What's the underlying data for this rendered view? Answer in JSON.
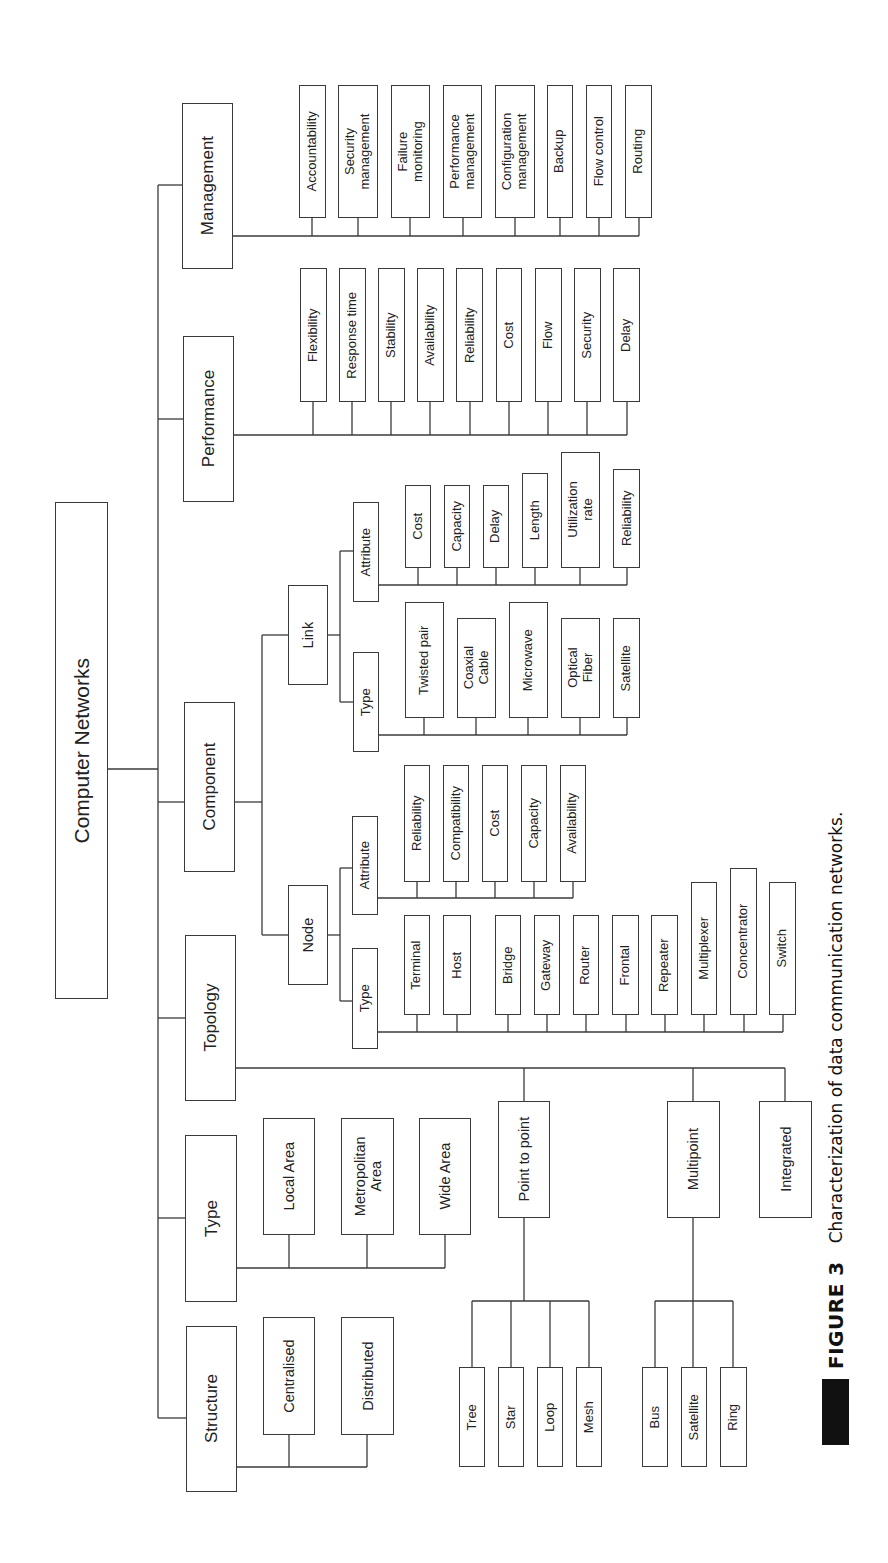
{
  "diagram": {
    "root": "Computer Networks",
    "branches": {
      "management": {
        "label": "Management",
        "children": [
          "Accountability",
          "Security\nmanagement",
          "Failure\nmonitoring",
          "Performance\nmanagement",
          "Configuration\nmanagement",
          "Backup",
          "Flow control",
          "Routing"
        ]
      },
      "performance": {
        "label": "Performance",
        "children": [
          "Flexibility",
          "Response time",
          "Stability",
          "Availability",
          "Reliability",
          "Cost",
          "Flow",
          "Security",
          "Delay"
        ]
      },
      "component": {
        "label": "Component",
        "link": {
          "label": "Link",
          "attribute": {
            "label": "Attribute",
            "children": [
              "Cost",
              "Capacity",
              "Delay",
              "Length",
              "Utilization\nrate",
              "Reliability"
            ]
          },
          "type": {
            "label": "Type",
            "children": [
              "Twisted pair",
              "Coaxial\nCable",
              "Microwave",
              "Optical\nFiber",
              "Satellite"
            ]
          }
        },
        "node": {
          "label": "Node",
          "attribute": {
            "label": "Attribute",
            "children": [
              "Reliability",
              "Compatibility",
              "Cost",
              "Capacity",
              "Availability"
            ]
          },
          "type": {
            "label": "Type",
            "children": [
              "Terminal",
              "Host",
              "Bridge",
              "Gateway",
              "Router",
              "Frontal",
              "Repeater",
              "Multiplexer",
              "Concentrator",
              "Switch"
            ]
          }
        }
      },
      "topology": {
        "label": "Topology",
        "point_to_point": {
          "label": "Point to point",
          "children": [
            "Tree",
            "Star",
            "Loop",
            "Mesh"
          ]
        },
        "multipoint": {
          "label": "Multipoint",
          "children": [
            "Bus",
            "Satellite",
            "Ring"
          ]
        },
        "integrated": {
          "label": "Integrated"
        }
      },
      "type": {
        "label": "Type",
        "children": [
          "Local Area",
          "Metropolitan\nArea",
          "Wide Area"
        ]
      },
      "structure": {
        "label": "Structure",
        "children": [
          "Centralised",
          "Distributed"
        ]
      }
    }
  },
  "caption": {
    "figure_label": "FIGURE 3",
    "text": "Characterization of data communication networks."
  }
}
